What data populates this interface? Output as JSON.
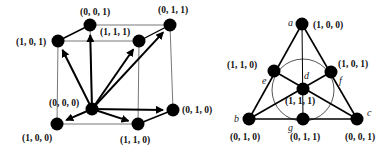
{
  "cube": {
    "nodes": [
      {
        "id": "v000",
        "label": "(0, 0, 0)",
        "x": 92,
        "y": 109,
        "lx": 49,
        "ly": 106
      },
      {
        "id": "v001",
        "label": "(0, 0, 1)",
        "x": 90,
        "y": 25,
        "lx": 80,
        "ly": 15
      },
      {
        "id": "v011",
        "label": "(0, 1, 1)",
        "x": 170,
        "y": 25,
        "lx": 158,
        "ly": 13
      },
      {
        "id": "v101",
        "label": "(1, 0, 1)",
        "x": 58,
        "y": 41,
        "lx": 16,
        "ly": 45
      },
      {
        "id": "v111",
        "label": "(1, 1, 1)",
        "x": 139,
        "y": 41,
        "lx": 100,
        "ly": 35
      },
      {
        "id": "v100",
        "label": "(1, 0, 0)",
        "x": 57,
        "y": 124,
        "lx": 22,
        "ly": 141
      },
      {
        "id": "v110",
        "label": "(1, 1, 0)",
        "x": 138,
        "y": 124,
        "lx": 120,
        "ly": 143
      },
      {
        "id": "v010",
        "label": "(0, 1, 0)",
        "x": 173,
        "y": 110,
        "lx": 182,
        "ly": 113
      }
    ],
    "edges": [
      [
        "v101",
        "v111"
      ],
      [
        "v111",
        "v110"
      ],
      [
        "v110",
        "v100"
      ],
      [
        "v100",
        "v101"
      ],
      [
        "v001",
        "v011"
      ],
      [
        "v011",
        "v010"
      ],
      [
        "v101",
        "v001"
      ],
      [
        "v111",
        "v011"
      ],
      [
        "v110",
        "v010"
      ],
      [
        "v001",
        "v000"
      ]
    ],
    "arrows_from": "v000",
    "arrows_to": [
      "v001",
      "v011",
      "v101",
      "v111",
      "v100",
      "v110",
      "v010"
    ]
  },
  "fano": {
    "nodes": [
      {
        "id": "a",
        "letter": "a",
        "label": "(1, 0, 0)",
        "x": 302,
        "y": 24,
        "lx": 313,
        "ly": 28,
        "tx": 288,
        "ty": 26
      },
      {
        "id": "e",
        "letter": "e",
        "label": "(1, 1, 0)",
        "x": 274,
        "y": 71,
        "lx": 227,
        "ly": 68,
        "tx": 262,
        "ty": 84
      },
      {
        "id": "f",
        "letter": "f",
        "label": "(1, 0, 1)",
        "x": 331,
        "y": 72,
        "lx": 338,
        "ly": 67,
        "tx": 339,
        "ty": 84
      },
      {
        "id": "d",
        "letter": "d",
        "label": "(1, 1, 1)",
        "x": 303,
        "y": 89,
        "lx": 285,
        "ly": 104,
        "tx": 304,
        "ty": 79
      },
      {
        "id": "b",
        "letter": "b",
        "label": "(0, 1, 0)",
        "x": 249,
        "y": 119,
        "lx": 230,
        "ly": 140,
        "tx": 234,
        "ty": 122
      },
      {
        "id": "g",
        "letter": "g",
        "label": "(0, 1, 1)",
        "x": 303,
        "y": 119,
        "lx": 290,
        "ly": 140,
        "tx": 288,
        "ty": 131
      },
      {
        "id": "c",
        "letter": "c",
        "label": "(0, 0, 1)",
        "x": 357,
        "y": 119,
        "lx": 345,
        "ly": 140,
        "tx": 367,
        "ty": 116
      }
    ],
    "lines": [
      [
        "a",
        "b"
      ],
      [
        "a",
        "c"
      ],
      [
        "b",
        "c"
      ],
      [
        "a",
        "g"
      ],
      [
        "b",
        "f"
      ],
      [
        "c",
        "e"
      ]
    ],
    "circle": {
      "cx": 303,
      "cy": 89,
      "r": 31
    }
  }
}
